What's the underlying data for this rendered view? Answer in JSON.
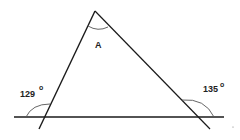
{
  "diagram": {
    "type": "triangle-exterior-angles",
    "apex_label": "A",
    "left_exterior_angle": {
      "value": "129",
      "unit": "o"
    },
    "right_exterior_angle": {
      "value": "135",
      "unit": "o"
    },
    "colors": {
      "line": "#1a1a1a",
      "arc": "#555555",
      "background": "#ffffff"
    }
  }
}
